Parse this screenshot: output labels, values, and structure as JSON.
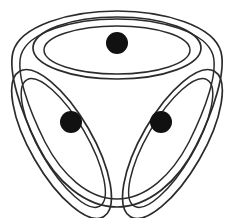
{
  "figure": {
    "background_color": "#ffffff",
    "stroke_color": "#2b2b2b",
    "node_color": "#111111",
    "stroke_width": 1.7,
    "symmetry_order": 3,
    "center": {
      "x": 117,
      "y": 112
    },
    "outer_boundary": {
      "name": "rounded-triangle-outline",
      "top_y": 11,
      "bottom_y": 207,
      "left_x": 12,
      "right_x": 222
    },
    "petals": [
      {
        "name": "petal-top",
        "rotation_deg": 0,
        "center": {
          "x": 117,
          "y": 48
        },
        "radius_x": 84,
        "radius_y": 31
      },
      {
        "name": "petal-lower-left",
        "rotation_deg": 120,
        "center": {
          "x": 81,
          "y": 132
        },
        "radius_x": 84,
        "radius_y": 31
      },
      {
        "name": "petal-lower-right",
        "rotation_deg": 240,
        "center": {
          "x": 153,
          "y": 132
        },
        "radius_x": 84,
        "radius_y": 31
      }
    ],
    "nodes": [
      {
        "name": "node-top",
        "x": 117,
        "y": 43,
        "radius": 11
      },
      {
        "name": "node-lower-left",
        "x": 71,
        "y": 122,
        "radius": 11
      },
      {
        "name": "node-lower-right",
        "x": 161,
        "y": 122,
        "radius": 11
      }
    ]
  }
}
